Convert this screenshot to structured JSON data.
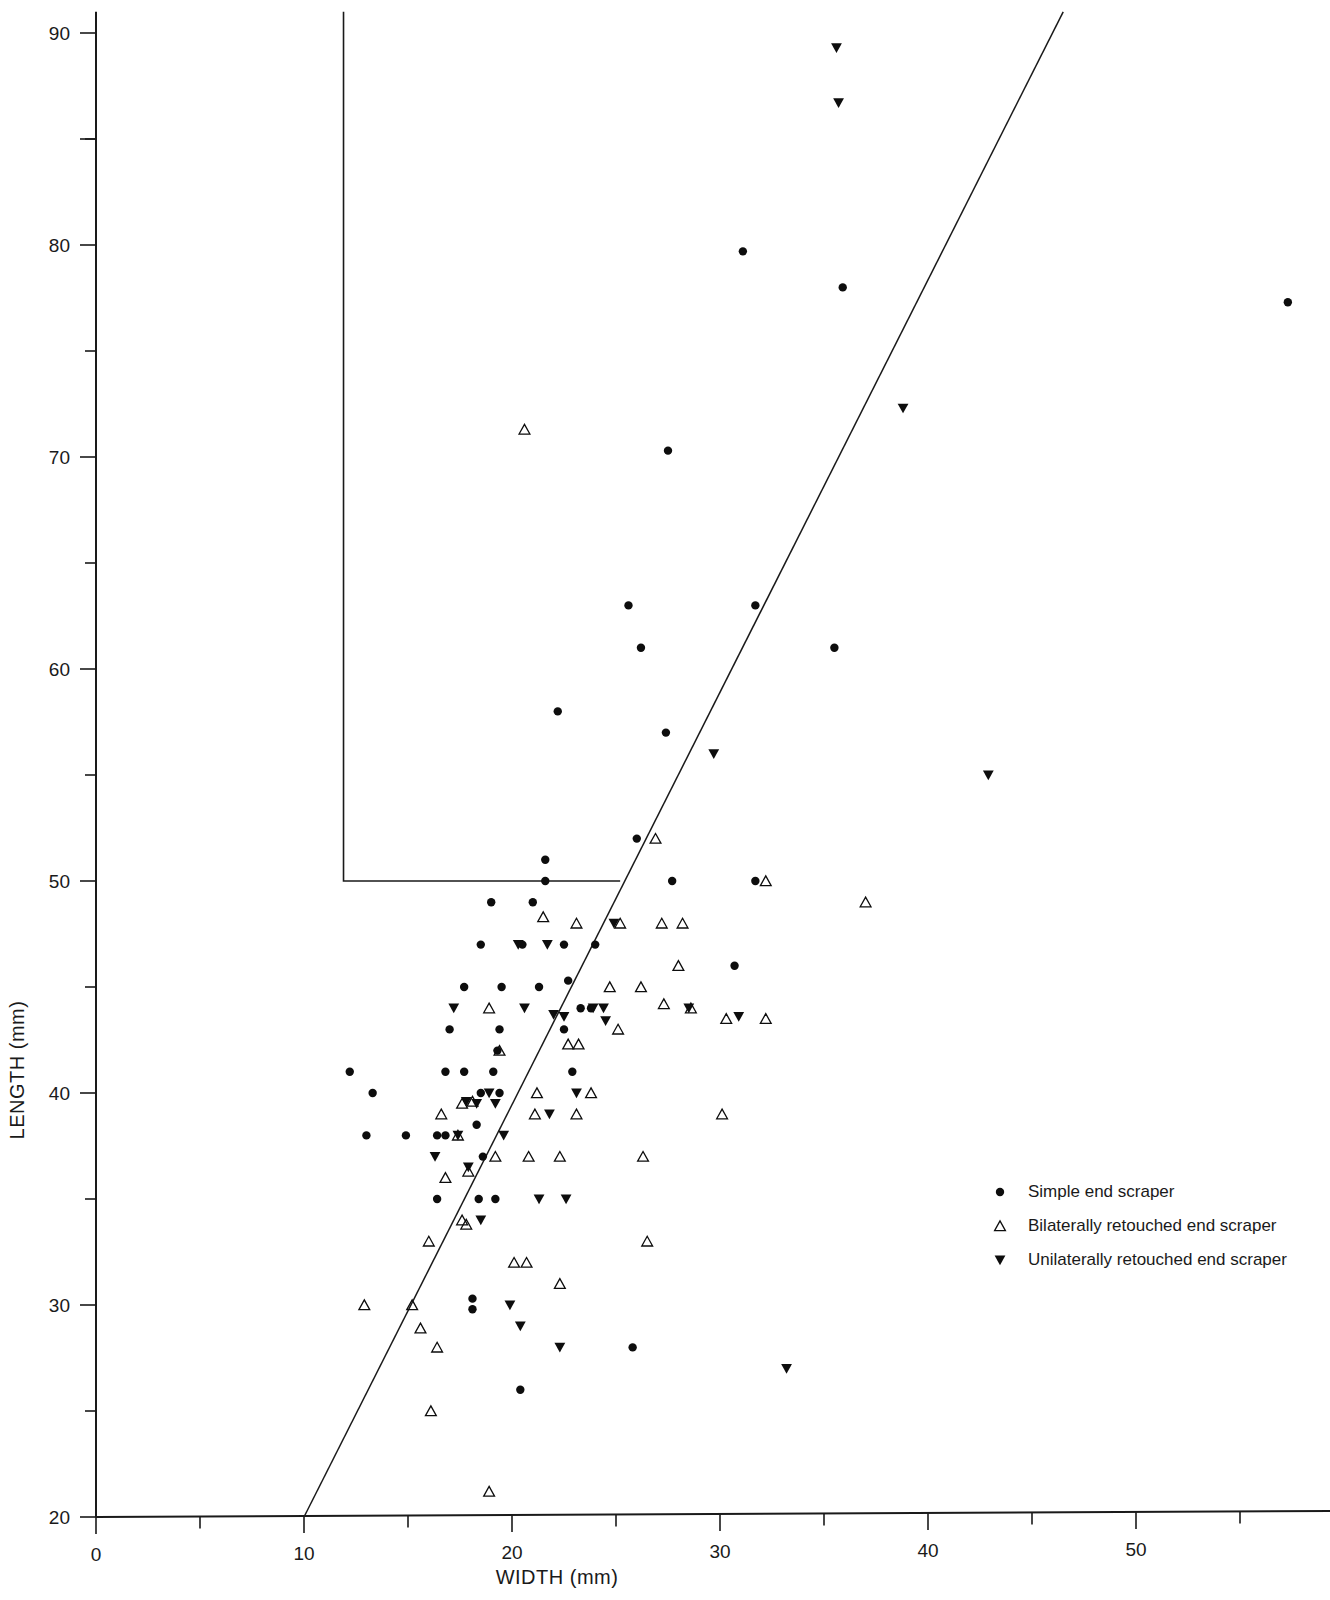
{
  "chart_data": {
    "type": "scatter",
    "title": "",
    "xlabel": "WIDTH  (mm)",
    "ylabel": "LENGTH  (mm)",
    "xlim": [
      0,
      58
    ],
    "ylim": [
      20,
      91
    ],
    "xticks_major": [
      0,
      10,
      20,
      30,
      40,
      50
    ],
    "xticks_minor": [
      5,
      15,
      25,
      35,
      45,
      55
    ],
    "yticks_major": [
      20,
      30,
      40,
      50,
      60,
      70,
      80,
      90
    ],
    "yticks_minor": [
      25,
      35,
      45,
      55,
      65,
      75,
      85
    ],
    "grid": false,
    "legend_position": "right",
    "regression_line": {
      "x0": 10,
      "y0": 20,
      "x1": 46.5,
      "y1": 91
    },
    "annotation_lines": [
      {
        "points": [
          [
            11.9,
            91
          ],
          [
            11.9,
            50
          ],
          [
            25.2,
            50
          ]
        ]
      }
    ],
    "series": [
      {
        "name": "Simple end scraper",
        "marker": "filled-circle",
        "color": "#0d0d0d",
        "points": [
          [
            35.9,
            78
          ],
          [
            31.1,
            79.7
          ],
          [
            27.5,
            70.3
          ],
          [
            25.6,
            63
          ],
          [
            26.2,
            61
          ],
          [
            31.7,
            63
          ],
          [
            35.5,
            61
          ],
          [
            22.2,
            58
          ],
          [
            27.4,
            57
          ],
          [
            26,
            52
          ],
          [
            27.7,
            50
          ],
          [
            31.7,
            50
          ],
          [
            21.6,
            51
          ],
          [
            21.6,
            50
          ],
          [
            19,
            49
          ],
          [
            21,
            49
          ],
          [
            18.5,
            47
          ],
          [
            20.5,
            47
          ],
          [
            22.5,
            47
          ],
          [
            24,
            47
          ],
          [
            17.7,
            45
          ],
          [
            19.5,
            45
          ],
          [
            21.3,
            45
          ],
          [
            22.7,
            45.3
          ],
          [
            30.7,
            46
          ],
          [
            17,
            43
          ],
          [
            19.4,
            43
          ],
          [
            22.5,
            43
          ],
          [
            19.3,
            42
          ],
          [
            23.3,
            44
          ],
          [
            23.8,
            44
          ],
          [
            12.2,
            41
          ],
          [
            16.8,
            41
          ],
          [
            17.7,
            41
          ],
          [
            19.1,
            41
          ],
          [
            22.9,
            41
          ],
          [
            13.3,
            40
          ],
          [
            18.5,
            40
          ],
          [
            19.4,
            40
          ],
          [
            13,
            38
          ],
          [
            14.9,
            38
          ],
          [
            16.4,
            38
          ],
          [
            16.8,
            38
          ],
          [
            18.3,
            38.5
          ],
          [
            18.6,
            37
          ],
          [
            16.4,
            35
          ],
          [
            18.4,
            35
          ],
          [
            19.2,
            35
          ],
          [
            18.1,
            30.3
          ],
          [
            18.1,
            29.8
          ],
          [
            20.4,
            26
          ],
          [
            25.8,
            28
          ],
          [
            57.3,
            77.3
          ]
        ]
      },
      {
        "name": "Bilaterally retouched end scraper",
        "marker": "open-triangle-up",
        "color": "#0d0d0d",
        "points": [
          [
            20.6,
            71.3
          ],
          [
            26.9,
            52
          ],
          [
            32.2,
            50
          ],
          [
            37,
            49
          ],
          [
            21.5,
            48.3
          ],
          [
            23.1,
            48
          ],
          [
            25.2,
            48
          ],
          [
            27.2,
            48
          ],
          [
            28.2,
            48
          ],
          [
            18.9,
            44
          ],
          [
            24.7,
            45
          ],
          [
            26.2,
            45
          ],
          [
            28,
            46
          ],
          [
            19.4,
            42
          ],
          [
            22.7,
            42.3
          ],
          [
            23.2,
            42.3
          ],
          [
            30.3,
            43.5
          ],
          [
            21.2,
            40
          ],
          [
            23.8,
            40
          ],
          [
            17.6,
            39.5
          ],
          [
            18.1,
            39.6
          ],
          [
            16.6,
            39
          ],
          [
            21.1,
            39
          ],
          [
            23.1,
            39
          ],
          [
            30.1,
            39
          ],
          [
            17.4,
            38
          ],
          [
            19.2,
            37
          ],
          [
            20.8,
            37
          ],
          [
            22.3,
            37
          ],
          [
            26.3,
            37
          ],
          [
            17.9,
            36.3
          ],
          [
            16.8,
            36
          ],
          [
            17.6,
            34
          ],
          [
            17.8,
            33.8
          ],
          [
            16,
            33
          ],
          [
            20.1,
            32
          ],
          [
            20.7,
            32
          ],
          [
            22.3,
            31
          ],
          [
            26.5,
            33
          ],
          [
            12.9,
            30
          ],
          [
            15.2,
            30
          ],
          [
            15.6,
            28.9
          ],
          [
            16.4,
            28
          ],
          [
            16.1,
            25
          ],
          [
            18.9,
            21.2
          ],
          [
            28.6,
            44
          ],
          [
            27.3,
            44.2
          ],
          [
            32.2,
            43.5
          ],
          [
            25.1,
            43
          ]
        ]
      },
      {
        "name": "Unilaterally retouched end scraper",
        "marker": "filled-triangle-down",
        "color": "#0d0d0d",
        "points": [
          [
            35.6,
            89.3
          ],
          [
            35.7,
            86.7
          ],
          [
            38.8,
            72.3
          ],
          [
            42.9,
            55
          ],
          [
            29.7,
            56
          ],
          [
            24.9,
            48
          ],
          [
            20.3,
            47
          ],
          [
            21.7,
            47
          ],
          [
            22,
            43.7
          ],
          [
            22.5,
            43.6
          ],
          [
            24.5,
            43.4
          ],
          [
            28.5,
            44
          ],
          [
            17.2,
            44
          ],
          [
            18.9,
            40
          ],
          [
            23.1,
            40
          ],
          [
            17.8,
            39.6
          ],
          [
            18.3,
            39.5
          ],
          [
            19.2,
            39.5
          ],
          [
            21.8,
            39
          ],
          [
            17.4,
            38
          ],
          [
            19.6,
            38
          ],
          [
            16.3,
            37
          ],
          [
            17.9,
            36.5
          ],
          [
            21.3,
            35
          ],
          [
            22.6,
            35
          ],
          [
            19.9,
            30
          ],
          [
            20.4,
            29
          ],
          [
            22.3,
            28
          ],
          [
            33.2,
            27
          ],
          [
            20.6,
            44
          ],
          [
            23.9,
            44
          ],
          [
            24.4,
            44
          ],
          [
            30.9,
            43.6
          ],
          [
            18.5,
            34
          ]
        ]
      }
    ]
  },
  "legend": {
    "items": [
      {
        "label": "Simple end scraper",
        "marker": "filled-circle"
      },
      {
        "label": "Bilaterally retouched end scraper",
        "marker": "open-triangle-up"
      },
      {
        "label": "Unilaterally retouched end scraper",
        "marker": "filled-triangle-down"
      }
    ]
  },
  "axes": {
    "x_title": "WIDTH  (mm)",
    "y_title": "LENGTH  (mm)",
    "x_labels": [
      "0",
      "10",
      "20",
      "30",
      "40",
      "50"
    ],
    "y_labels": [
      "20",
      "30",
      "40",
      "50",
      "60",
      "70",
      "80",
      "90"
    ]
  }
}
